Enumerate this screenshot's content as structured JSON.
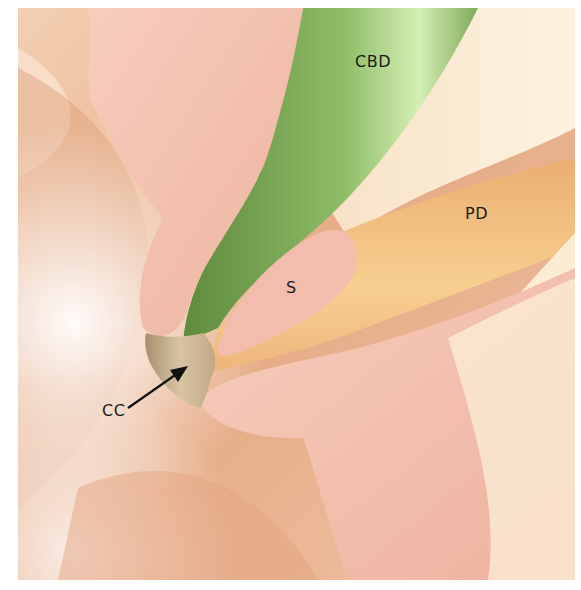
{
  "figure": {
    "labels": {
      "cbd": "CBD",
      "pd": "PD",
      "s": "S",
      "cc": "CC"
    },
    "colors": {
      "tissue_light": "#f6d9c0",
      "tissue_dark": "#d9956e",
      "pink_fold": "#f2bfae",
      "cbd_green": "#7fa65a",
      "cbd_highlight": "#d3ecb0",
      "pd_orange": "#f0b57a",
      "cream": "#fbefd8",
      "arrow": "#111111"
    }
  }
}
